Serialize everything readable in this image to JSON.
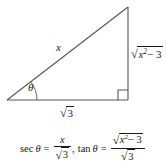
{
  "figure": {
    "type": "right-triangle-trigonometry-diagram",
    "background_color": "#ffffff",
    "stroke_color": "#555555",
    "text_color": "#1a1a1a",
    "triangle": {
      "vertices": {
        "left": [
          7,
          100
        ],
        "bottom_right": [
          128,
          100
        ],
        "apex": [
          128,
          7
        ]
      },
      "right_angle_at": "bottom-right",
      "right_angle_marker": true,
      "angle_arc_at": "left",
      "angle_symbol": "θ"
    },
    "labels": {
      "hypotenuse": "x",
      "angle": "θ",
      "adjacent_radicand": "3",
      "opposite_radicand_base": "x",
      "opposite_radicand_exponent": "2",
      "opposite_radicand_rest": "− 3"
    }
  },
  "formula": {
    "sec_lhs": "sec",
    "sec_theta": "θ",
    "equals": "=",
    "sec_numerator": "x",
    "sec_denominator_radicand": "3",
    "comma": ",",
    "tan_lhs": "tan",
    "tan_theta": "θ",
    "equals2": "=",
    "tan_numerator_base": "x",
    "tan_numerator_exponent": "2",
    "tan_numerator_rest": "− 3",
    "tan_denominator_radicand": "3",
    "radical_sign": "√"
  }
}
